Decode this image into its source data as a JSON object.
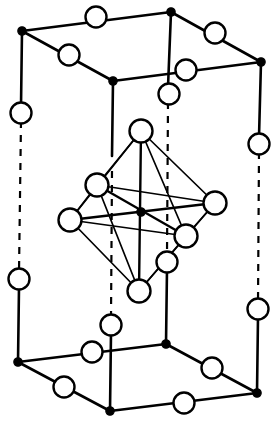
{
  "figure": {
    "type": "crystal-structure-diagram",
    "background_color": "#ffffff",
    "line_color": "#000000",
    "open_atom_fill": "#ffffff",
    "filled_atom_fill": "#000000"
  },
  "cell": {
    "description": "tetragonal / body-centred unit cell drawn in oblique projection",
    "corner_label": "corner-atom",
    "corners": [
      {
        "name": "top-back-left",
        "x": 22,
        "y": 31,
        "style": "filled",
        "r": 4.2
      },
      {
        "name": "top-back-center",
        "x": 171,
        "y": 12,
        "style": "filled",
        "r": 4.2
      },
      {
        "name": "top-back-right",
        "x": 261,
        "y": 62,
        "style": "filled",
        "r": 4.2
      },
      {
        "name": "top-front-left",
        "x": 113,
        "y": 81,
        "style": "filled",
        "r": 4.2
      },
      {
        "name": "bottom-back-left",
        "x": 18,
        "y": 362,
        "style": "filled",
        "r": 4.2
      },
      {
        "name": "bottom-back-center",
        "x": 166,
        "y": 344,
        "style": "filled",
        "r": 4.2
      },
      {
        "name": "bottom-back-right",
        "x": 257,
        "y": 393,
        "style": "filled",
        "r": 4.2
      },
      {
        "name": "bottom-front-left",
        "x": 110,
        "y": 411,
        "style": "filled",
        "r": 4.2
      }
    ],
    "edges_solid": [
      {
        "name": "top-edge-back-left-to-back-center",
        "x1": 22,
        "y1": 31,
        "x2": 171,
        "y2": 12
      },
      {
        "name": "top-edge-back-center-to-back-right",
        "x1": 171,
        "y1": 12,
        "x2": 261,
        "y2": 62
      },
      {
        "name": "top-edge-back-left-to-front-left",
        "x1": 22,
        "y1": 31,
        "x2": 113,
        "y2": 81
      },
      {
        "name": "top-edge-front-left-to-back-right",
        "x1": 113,
        "y1": 81,
        "x2": 261,
        "y2": 62
      },
      {
        "name": "bottom-edge-back-left-to-back-center",
        "x1": 18,
        "y1": 362,
        "x2": 166,
        "y2": 344
      },
      {
        "name": "bottom-edge-back-center-to-back-right",
        "x1": 166,
        "y1": 344,
        "x2": 257,
        "y2": 393
      },
      {
        "name": "bottom-edge-back-left-to-front-left",
        "x1": 18,
        "y1": 362,
        "x2": 110,
        "y2": 411
      },
      {
        "name": "bottom-edge-front-left-to-back-right",
        "x1": 110,
        "y1": 411,
        "x2": 257,
        "y2": 393
      },
      {
        "name": "vertical-edge-left-upper",
        "x1": 22,
        "y1": 31,
        "x2": 21,
        "y2": 106
      },
      {
        "name": "vertical-edge-left-lower",
        "x1": 19,
        "y1": 287,
        "x2": 18,
        "y2": 362
      },
      {
        "name": "vertical-edge-right-upper",
        "x1": 261,
        "y1": 62,
        "x2": 259,
        "y2": 137
      },
      {
        "name": "vertical-edge-right-lower",
        "x1": 258,
        "y1": 317,
        "x2": 257,
        "y2": 393
      },
      {
        "name": "vertical-edge-backcenter-upper",
        "x1": 171,
        "y1": 12,
        "x2": 168,
        "y2": 87
      },
      {
        "name": "vertical-edge-backcenter-lower",
        "x1": 167,
        "y1": 269,
        "x2": 166,
        "y2": 344
      },
      {
        "name": "vertical-edge-frontleft-upper",
        "x1": 113,
        "y1": 81,
        "x2": 112,
        "y2": 156
      },
      {
        "name": "vertical-edge-frontleft-lower",
        "x1": 111,
        "y1": 333,
        "x2": 110,
        "y2": 411
      }
    ],
    "edges_dashed": [
      {
        "name": "vertical-edge-left-hidden-run",
        "x1": 21,
        "y1": 121,
        "x2": 19,
        "y2": 272
      },
      {
        "name": "vertical-edge-right-hidden-run",
        "x1": 259,
        "y1": 152,
        "x2": 258,
        "y2": 302
      },
      {
        "name": "vertical-edge-backcenter-hidden-run",
        "x1": 168,
        "y1": 102,
        "x2": 167,
        "y2": 254
      },
      {
        "name": "vertical-edge-frontleft-hidden-run",
        "x1": 112,
        "y1": 171,
        "x2": 111,
        "y2": 318
      }
    ],
    "edge_atoms": [
      {
        "name": "top-back-edge-atom",
        "x": 96,
        "y": 17,
        "r": 10.5
      },
      {
        "name": "top-right-edge-atom",
        "x": 215,
        "y": 33,
        "r": 10.5
      },
      {
        "name": "top-left-edge-atom",
        "x": 69,
        "y": 55,
        "r": 10.5
      },
      {
        "name": "top-front-edge-atom",
        "x": 186,
        "y": 70,
        "r": 10.5
      },
      {
        "name": "left-vertical-upper-atom",
        "x": 21,
        "y": 113,
        "r": 10.5
      },
      {
        "name": "backcenter-vertical-upper-atom",
        "x": 169,
        "y": 94,
        "r": 10.5
      },
      {
        "name": "right-vertical-upper-atom",
        "x": 259,
        "y": 144,
        "r": 10.5
      },
      {
        "name": "left-vertical-lower-atom",
        "x": 19,
        "y": 279,
        "r": 10.5
      },
      {
        "name": "frontleft-vertical-lower-atom",
        "x": 111,
        "y": 325,
        "r": 10.5
      },
      {
        "name": "backcenter-vertical-lower-atom",
        "x": 167,
        "y": 262,
        "r": 10.5
      },
      {
        "name": "right-vertical-lower-atom",
        "x": 258,
        "y": 309,
        "r": 10.5
      },
      {
        "name": "bottom-back-edge-atom",
        "x": 92,
        "y": 352,
        "r": 10.5
      },
      {
        "name": "bottom-right-edge-atom",
        "x": 212,
        "y": 368,
        "r": 10.5
      },
      {
        "name": "bottom-left-edge-atom",
        "x": 64,
        "y": 387,
        "r": 10.5
      },
      {
        "name": "bottom-front-edge-atom",
        "x": 184,
        "y": 403,
        "r": 10.5
      }
    ]
  },
  "octahedron": {
    "description": "six-coordinate octahedron about the body-centre site",
    "center": {
      "name": "octahedron-center-atom",
      "x": 141,
      "y": 212,
      "r": 4.2
    },
    "vertices": [
      {
        "name": "octa-vertex-top",
        "x": 141,
        "y": 131,
        "r": 11.5
      },
      {
        "name": "octa-vertex-bottom",
        "x": 139,
        "y": 291,
        "r": 11.5
      },
      {
        "name": "octa-vertex-left",
        "x": 70,
        "y": 220,
        "r": 11.5
      },
      {
        "name": "octa-vertex-right",
        "x": 215,
        "y": 203,
        "r": 11.5
      },
      {
        "name": "octa-vertex-back-left",
        "x": 97,
        "y": 185,
        "r": 11.5
      },
      {
        "name": "octa-vertex-front-right",
        "x": 186,
        "y": 236,
        "r": 11.5
      }
    ],
    "edges": [
      {
        "name": "octa-edge-top-to-left",
        "x1": 141,
        "y1": 131,
        "x2": 70,
        "y2": 220
      },
      {
        "name": "octa-edge-top-to-right",
        "x1": 141,
        "y1": 131,
        "x2": 215,
        "y2": 203
      },
      {
        "name": "octa-edge-top-to-back-left",
        "x1": 141,
        "y1": 131,
        "x2": 97,
        "y2": 185
      },
      {
        "name": "octa-edge-top-to-front-right",
        "x1": 141,
        "y1": 131,
        "x2": 186,
        "y2": 236
      },
      {
        "name": "octa-edge-bottom-to-left",
        "x1": 139,
        "y1": 291,
        "x2": 70,
        "y2": 220
      },
      {
        "name": "octa-edge-bottom-to-right",
        "x1": 139,
        "y1": 291,
        "x2": 215,
        "y2": 203
      },
      {
        "name": "octa-edge-bottom-to-back-left",
        "x1": 139,
        "y1": 291,
        "x2": 97,
        "y2": 185
      },
      {
        "name": "octa-edge-bottom-to-front-right",
        "x1": 139,
        "y1": 291,
        "x2": 186,
        "y2": 236
      },
      {
        "name": "octa-edge-left-to-back-left",
        "x1": 70,
        "y1": 220,
        "x2": 97,
        "y2": 185
      },
      {
        "name": "octa-edge-back-left-to-right",
        "x1": 97,
        "y1": 185,
        "x2": 215,
        "y2": 203
      },
      {
        "name": "octa-edge-right-to-front-right",
        "x1": 215,
        "y1": 203,
        "x2": 186,
        "y2": 236
      },
      {
        "name": "octa-edge-front-right-to-left",
        "x1": 186,
        "y1": 236,
        "x2": 70,
        "y2": 220
      }
    ],
    "axes": [
      {
        "name": "octa-axis-vertical",
        "x1": 141,
        "y1": 131,
        "x2": 139,
        "y2": 291
      },
      {
        "name": "octa-axis-horizontal",
        "x1": 70,
        "y1": 220,
        "x2": 215,
        "y2": 203
      },
      {
        "name": "octa-axis-diagonal",
        "x1": 97,
        "y1": 185,
        "x2": 186,
        "y2": 236
      }
    ]
  },
  "chart_data": {
    "type": "scatter",
    "xlabel": "",
    "ylabel": "",
    "xlim": [
      0,
      274
    ],
    "ylim": [
      0,
      421
    ],
    "grid": false,
    "legend": null,
    "series": [
      {
        "name": "corner-atoms-filled",
        "marker": "filled-circle",
        "x": [
          22,
          171,
          261,
          113,
          18,
          166,
          257,
          110
        ],
        "y": [
          31,
          12,
          62,
          81,
          362,
          344,
          393,
          411
        ]
      },
      {
        "name": "edge-atoms-open",
        "marker": "open-circle",
        "x": [
          96,
          215,
          69,
          186,
          21,
          169,
          259,
          19,
          111,
          167,
          258,
          92,
          212,
          64,
          184
        ],
        "y": [
          17,
          33,
          55,
          70,
          113,
          94,
          144,
          279,
          325,
          262,
          309,
          352,
          368,
          387,
          403
        ]
      },
      {
        "name": "octahedron-vertices-open",
        "marker": "open-circle",
        "x": [
          141,
          139,
          70,
          215,
          97,
          186
        ],
        "y": [
          131,
          291,
          220,
          203,
          185,
          236
        ]
      },
      {
        "name": "octahedron-center-filled",
        "marker": "filled-circle",
        "x": [
          141
        ],
        "y": [
          212
        ]
      }
    ]
  }
}
